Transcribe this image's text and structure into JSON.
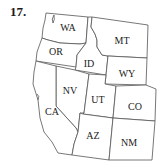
{
  "problem_number": "17.",
  "map": {
    "title": "Western United States",
    "states": [
      {
        "abbr": "WA",
        "label_x": 68,
        "label_y": 31
      },
      {
        "abbr": "OR",
        "label_x": 56,
        "label_y": 55
      },
      {
        "abbr": "ID",
        "label_x": 89,
        "label_y": 67
      },
      {
        "abbr": "MT",
        "label_x": 122,
        "label_y": 44
      },
      {
        "abbr": "WY",
        "label_x": 127,
        "label_y": 77
      },
      {
        "abbr": "NV",
        "label_x": 70,
        "label_y": 94
      },
      {
        "abbr": "UT",
        "label_x": 98,
        "label_y": 103
      },
      {
        "abbr": "CO",
        "label_x": 135,
        "label_y": 110
      },
      {
        "abbr": "CA",
        "label_x": 52,
        "label_y": 115
      },
      {
        "abbr": "AZ",
        "label_x": 93,
        "label_y": 139
      },
      {
        "abbr": "NM",
        "label_x": 129,
        "label_y": 146
      }
    ]
  }
}
